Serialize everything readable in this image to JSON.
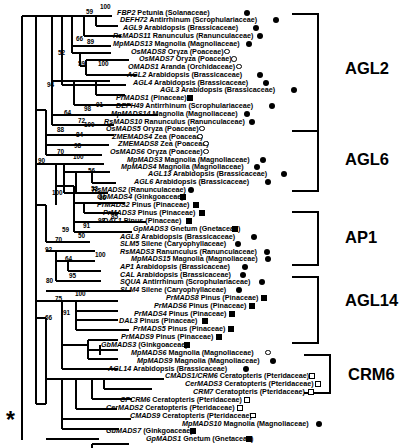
{
  "figure": {
    "type": "phylogenetic-tree",
    "root_marker": "*",
    "marker_legend": {
      "filled-circle": "angiosperm",
      "open-circle": "angiosperm (monocot/other)",
      "filled-square": "gymnosperm",
      "open-square": "fern (Pteridaceae)"
    }
  },
  "clades": [
    {
      "name": "AGL2",
      "label_x": 345,
      "label_y": 68,
      "bracket_x": 318,
      "bracket_top": 14,
      "bracket_bottom": 131
    },
    {
      "name": "AGL6",
      "label_x": 345,
      "label_y": 159,
      "bracket_x": 318,
      "bracket_top": 131,
      "bracket_bottom": 191
    },
    {
      "name": "AP1",
      "label_x": 345,
      "label_y": 237,
      "bracket_x": 318,
      "bracket_top": 212,
      "bracket_bottom": 265
    },
    {
      "name": "AGL14",
      "label_x": 345,
      "label_y": 300,
      "bracket_x": 318,
      "bracket_top": 277,
      "bracket_bottom": 343
    },
    {
      "name": "CRM6",
      "label_x": 348,
      "label_y": 374,
      "bracket_x": 330,
      "bracket_top": 355,
      "bracket_bottom": 393
    }
  ],
  "taxa": [
    {
      "gene": "FBP2",
      "rest": "Petunia (Solanaceae)",
      "y": 16,
      "tx": 117,
      "mx": 244,
      "marker": "fc"
    },
    {
      "gene": "DEFH72",
      "rest": "Antirrhinum (Scrophulariaceae)",
      "y": 26,
      "tx": 120,
      "mx": 273,
      "marker": "fc"
    },
    {
      "gene": "AGL9",
      "rest": "Arabidopsis (Brassicaceae)",
      "y": 36,
      "tx": 123,
      "mx": 253,
      "marker": "fc"
    },
    {
      "gene": "RsMADS11",
      "rest": "Ranunculus (Ranunculaceae)",
      "y": 46,
      "tx": 113,
      "mx": 257,
      "marker": "fc"
    },
    {
      "gene": "MpMADS13",
      "rest": "Magnolia (Magnoliaceae)",
      "y": 56,
      "tx": 113,
      "mx": 246,
      "marker": "fc"
    },
    {
      "gene": "OsMADS8",
      "rest": "Oryza (Poaceae)",
      "y": 66,
      "tx": 131,
      "mx": 224,
      "marker": "oc"
    },
    {
      "gene": "OsMADS7",
      "rest": "Oryza (Poaceae)",
      "y": 75,
      "tx": 139,
      "mx": 231,
      "marker": "oc"
    },
    {
      "gene": "OMADS1",
      "rest": "Aranda (Orchidaceae)",
      "y": 85,
      "tx": 128,
      "mx": 236,
      "marker": "oc"
    },
    {
      "gene": "AGL2",
      "rest": "Arabidopsis (Brassicaceae)",
      "y": 95,
      "tx": 127,
      "mx": 257,
      "marker": "fc"
    },
    {
      "gene": "AGL4",
      "rest": "Arabidopsis (Brassicaceae)",
      "y": 105,
      "tx": 133,
      "mx": 263,
      "marker": "fc"
    },
    {
      "gene": "AGL3",
      "rest": "Arabidopsis (Brassicaceae)",
      "y": 115,
      "tx": 160,
      "mx": 291,
      "marker": "fc"
    },
    {
      "gene": "PrMADS1",
      "rest": "(Pinaceae)",
      "y": 125,
      "tx": 116,
      "mx": 187,
      "marker": "fs"
    },
    {
      "gene": "DEFH49",
      "rest": "Antirrhinum (Scrophulariaceae)",
      "y": 135,
      "tx": 116,
      "mx": 269,
      "marker": "fc"
    },
    {
      "gene": "MpMADS14",
      "rest": "Magnolia (Magnoliaceae)",
      "y": 145,
      "tx": 111,
      "mx": 244,
      "marker": "fc"
    },
    {
      "gene": "RsMADS10",
      "rest": "Ranunculus (Ranunculaceae)",
      "y": 155,
      "tx": 104,
      "mx": 249,
      "marker": "fc"
    },
    {
      "gene": "OsMADS5",
      "rest": "Oryza (Poaceae)",
      "y": 164,
      "tx": 106,
      "mx": 199,
      "marker": "oc"
    },
    {
      "gene": "ZMEMADS4",
      "rest": "Zea (Poaceae)",
      "y": 174,
      "tx": 112,
      "mx": 197,
      "marker": "oc"
    },
    {
      "gene": "ZMEMADS8",
      "rest": "Zea (Poaceae)",
      "y": 183,
      "tx": 118,
      "mx": 203,
      "marker": "oc"
    },
    {
      "gene": "OsMADS6",
      "rest": "Oryza (Poaceae)",
      "y": 193,
      "tx": 110,
      "mx": 203,
      "marker": "oc"
    },
    {
      "gene": "MpMADS3",
      "rest": "Magnolia (Magnoliaceae)",
      "y": 203,
      "tx": 127,
      "mx": 260,
      "marker": "fc"
    },
    {
      "gene": "MpMADS4",
      "rest": "Magnolia (Magnoliaceae)",
      "y": 213,
      "tx": 121,
      "mx": 254,
      "marker": "fc"
    },
    {
      "gene": "AGL13",
      "rest": "Arabidopsis (Brassicaceae)",
      "y": 222,
      "tx": 148,
      "mx": 281,
      "marker": "fc"
    },
    {
      "gene": "AGL6",
      "rest": "Arabidopsis (Brassicaceae)",
      "y": 232,
      "tx": 134,
      "mx": 265,
      "marker": "fc"
    },
    {
      "gene": "RsMADS2",
      "rest": "(Ranunculaceae)",
      "y": 242,
      "tx": 92,
      "mx": 188,
      "marker": "fc"
    },
    {
      "gene": "GbMADS4",
      "rest": "(Ginkgoaceae)",
      "y": 251,
      "tx": 97,
      "mx": 180,
      "marker": "fs"
    },
    {
      "gene": "PrMADS2",
      "rest": "Pinus (Pinaceae)",
      "y": 261,
      "tx": 97,
      "mx": 193,
      "marker": "fs"
    },
    {
      "gene": "PrMADS3",
      "rest": "Pinus (Pinaceae)",
      "y": 271,
      "tx": 103,
      "mx": 199,
      "marker": "fs"
    },
    {
      "gene": "DAL1",
      "rest": "Pinus (Pinaceae)",
      "y": 281,
      "tx": 103,
      "mx": 186,
      "marker": "fs"
    },
    {
      "gene": "GpMADS3",
      "rest": "Gnetum (Gnetaceae)",
      "y": 291,
      "tx": 133,
      "mx": 232,
      "marker": "fs"
    },
    {
      "gene": "AGL8",
      "rest": "Arabidopsis (Brassicaceae)",
      "y": 301,
      "tx": 120,
      "mx": 251,
      "marker": "fc"
    },
    {
      "gene": "SLM5",
      "rest": "Silene (Caryophyllaceae)",
      "y": 311,
      "tx": 120,
      "mx": 235,
      "marker": "fc"
    },
    {
      "gene": "RsMADS3",
      "rest": "Ranunculus (Ranunculaceae)",
      "y": 320,
      "tx": 120,
      "mx": 264,
      "marker": "fc"
    },
    {
      "gene": "MpMADS15",
      "rest": "Magnolia (Magnoliaceae)",
      "y": 330,
      "tx": 131,
      "mx": 265,
      "marker": "fc"
    },
    {
      "gene": "AP1",
      "rest": "Arabidopsis (Brassicaceae)",
      "y": 340,
      "tx": 120,
      "mx": 242,
      "marker": "fc"
    },
    {
      "gene": "CAL",
      "rest": "Arabidopsis (Brassicaceae)",
      "y": 350,
      "tx": 120,
      "mx": 240,
      "marker": "fc"
    },
    {
      "gene": "SQUA",
      "rest": "Antirrhinum (Scrophulariaceae)",
      "y": 359,
      "tx": 120,
      "mx": 259,
      "marker": "fc"
    },
    {
      "gene": "SLM4",
      "rest": "Silene (Caryophyllaceae)",
      "y": 369,
      "tx": 120,
      "mx": 236,
      "marker": "fc"
    },
    {
      "gene": "PrMADS8",
      "rest": "Pinus (Pinaceae)",
      "y": 379,
      "tx": 166,
      "mx": 261,
      "marker": "fs"
    },
    {
      "gene": "PrMADS6",
      "rest": "Pinus (Pinaceae)",
      "y": 389,
      "tx": 154,
      "mx": 249,
      "marker": "fs"
    },
    {
      "gene": "PrMADS4",
      "rest": "Pinus (Pinaceae)",
      "y": 399,
      "tx": 134,
      "mx": 229,
      "marker": "fs"
    },
    {
      "gene": "DAL3",
      "rest": "Pinus (Pinaceae)",
      "y": 409,
      "tx": 119,
      "mx": 202,
      "marker": "fs"
    },
    {
      "gene": "PrMADS5",
      "rest": "Pinus (Pinaceae)",
      "y": 419,
      "tx": 133,
      "mx": 228,
      "marker": "fs"
    },
    {
      "gene": "PrMADS9",
      "rest": "Pinus (Pinaceae)",
      "y": 429,
      "tx": 121,
      "mx": 216,
      "marker": "fs"
    },
    {
      "gene": "GbMADS3",
      "rest": "(Ginkgoaceae)",
      "y": 439,
      "tx": 101,
      "mx": 184,
      "marker": "fs"
    },
    {
      "gene": "MpMADS6",
      "rest": "Magnolia (Magnoliaceae)",
      "y": 449,
      "tx": 131,
      "mx": 265,
      "marker": "oc"
    },
    {
      "gene": "MpMADS9",
      "rest": "Magnolia (Magnoliaceae)",
      "y": 459,
      "tx": 137,
      "mx": 270,
      "marker": "fc"
    },
    {
      "gene": "AGL14",
      "rest": "Arabidopsis (Brassicaceae)",
      "y": 469,
      "tx": 108,
      "mx": 243,
      "marker": "fc"
    },
    {
      "gene": "CMADS1/CRM6",
      "rest": "Ceratopteris (Pteridaceae)",
      "y": 479,
      "tx": 165,
      "mx": 309,
      "marker": "os"
    },
    {
      "gene": "CerMADS3",
      "rest": "Ceratopteris (Pteridaceae)",
      "y": 489,
      "tx": 185,
      "mx": 315,
      "marker": "os"
    },
    {
      "gene": "CRM7",
      "rest": "Ceratopteris (Pteridaceae)",
      "y": 499,
      "tx": 193,
      "mx": 308,
      "marker": "os"
    },
    {
      "gene": "CPCRM6",
      "rest": "Ceratopteris (Pteridaceae)",
      "y": 509,
      "tx": 120,
      "mx": 244,
      "marker": "os"
    },
    {
      "gene": "CerMADS2",
      "rest": "Ceratopteris (Pteridaceae)",
      "y": 519,
      "tx": 106,
      "mx": 237,
      "marker": "os"
    },
    {
      "gene": "CMADS9",
      "rest": "Ceratopteris (Pteridaceae)",
      "y": 529,
      "tx": 130,
      "mx": 250,
      "marker": "os"
    },
    {
      "gene": "MpMADS10",
      "rest": "Magnolia (Magnoliaceae)",
      "y": 539,
      "tx": 182,
      "mx": 316,
      "marker": "fc"
    },
    {
      "gene": "GbMADS7",
      "rest": "(Ginkgoaceae)",
      "y": 549,
      "tx": 106,
      "mx": 190,
      "marker": "fs"
    },
    {
      "gene": "GpMADS1",
      "rest": "Gnetum (Gnetaceae)",
      "y": 559,
      "tx": 146,
      "mx": 246,
      "marker": "fs"
    }
  ],
  "bootstrap": [
    {
      "v": "100",
      "x": 100,
      "y": 9
    },
    {
      "v": "59",
      "x": 86,
      "y": 15
    },
    {
      "v": "66",
      "x": 76,
      "y": 49
    },
    {
      "v": "89",
      "x": 87,
      "y": 53
    },
    {
      "v": "52",
      "x": 58,
      "y": 68
    },
    {
      "v": "59",
      "x": 78,
      "y": 81
    },
    {
      "v": "100",
      "x": 98,
      "y": 81
    },
    {
      "v": "94",
      "x": 47,
      "y": 108
    },
    {
      "v": "91",
      "x": 96,
      "y": 133
    },
    {
      "v": "98",
      "x": 84,
      "y": 139
    },
    {
      "v": "64",
      "x": 64,
      "y": 144
    },
    {
      "v": "72",
      "x": 78,
      "y": 154
    },
    {
      "v": "100",
      "x": 84,
      "y": 159
    },
    {
      "v": "88",
      "x": 57,
      "y": 165
    },
    {
      "v": "84",
      "x": 76,
      "y": 172
    },
    {
      "v": "98",
      "x": 74,
      "y": 186
    },
    {
      "v": "70",
      "x": 57,
      "y": 193
    },
    {
      "v": "100",
      "x": 73,
      "y": 200
    },
    {
      "v": "90",
      "x": 38,
      "y": 205
    },
    {
      "v": "56",
      "x": 88,
      "y": 218
    },
    {
      "v": "100",
      "x": 52,
      "y": 246
    },
    {
      "v": "53",
      "x": 91,
      "y": 240
    },
    {
      "v": "86",
      "x": 99,
      "y": 252
    },
    {
      "v": "91",
      "x": 83,
      "y": 287
    },
    {
      "v": "98",
      "x": 98,
      "y": 281
    },
    {
      "v": "85",
      "x": 111,
      "y": 276
    },
    {
      "v": "59",
      "x": 62,
      "y": 293
    },
    {
      "v": "50",
      "x": 78,
      "y": 300
    },
    {
      "v": "70",
      "x": 55,
      "y": 305
    },
    {
      "v": "92",
      "x": 45,
      "y": 318
    },
    {
      "v": "64",
      "x": 65,
      "y": 330
    },
    {
      "v": "100",
      "x": 95,
      "y": 325
    },
    {
      "v": "80",
      "x": 46,
      "y": 357
    },
    {
      "v": "95",
      "x": 69,
      "y": 351
    },
    {
      "v": "100",
      "x": 75,
      "y": 374
    },
    {
      "v": "75",
      "x": 55,
      "y": 380
    },
    {
      "v": "91",
      "x": 63,
      "y": 398
    },
    {
      "v": "66",
      "x": 45,
      "y": 404
    }
  ]
}
